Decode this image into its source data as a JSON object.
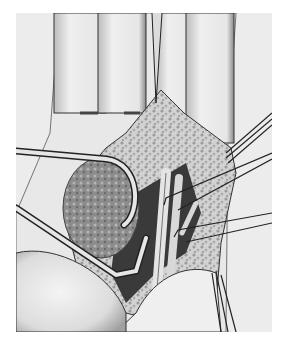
{
  "image": {
    "kind": "surgical illustration",
    "subject": "palmar view of hand with incision exposing a mass, retracted by hooks and forceps",
    "palette": {
      "background": "#ffffff",
      "skin_light": "#ececec",
      "skin_shadow": "#9a9a9a",
      "tissue_texture": "#bdbdbd",
      "mass_dark": "#6e6e6e",
      "deep_cavity": "#2e2e2e",
      "instrument": "#dcdcdc",
      "outline": "#1e1e1e"
    }
  }
}
